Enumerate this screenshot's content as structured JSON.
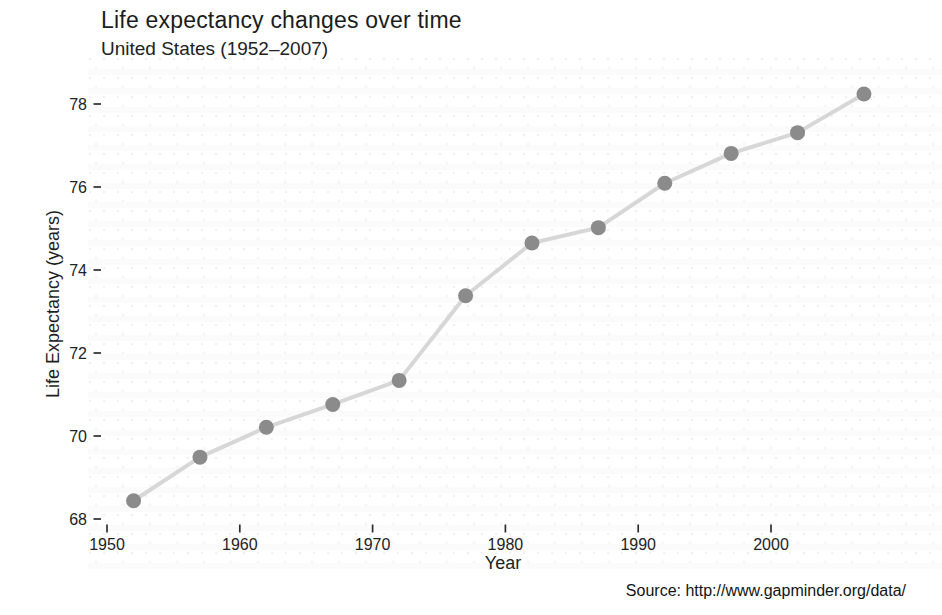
{
  "chart_data": {
    "type": "line",
    "title": "Life expectancy changes over time",
    "subtitle": "United States (1952–2007)",
    "caption": "Source: http://www.gapminder.org/data/",
    "xlabel": "Year",
    "ylabel": "Life Expectancy (years)",
    "x": [
      1952,
      1957,
      1962,
      1967,
      1972,
      1977,
      1982,
      1987,
      1992,
      1997,
      2002,
      2007
    ],
    "series": [
      {
        "name": "United States",
        "values": [
          68.44,
          69.49,
          70.21,
          70.76,
          71.34,
          73.38,
          74.65,
          75.02,
          76.09,
          76.81,
          77.31,
          78.24
        ]
      }
    ],
    "x_ticks": [
      1950,
      1960,
      1970,
      1980,
      1990,
      2000
    ],
    "y_ticks": [
      68,
      70,
      72,
      74,
      76,
      78
    ],
    "xlim": [
      1949.2,
      2010.2
    ],
    "ylim": [
      67.95,
      78.5
    ],
    "grid": false,
    "legend": false,
    "marker": "circle",
    "colors": {
      "point": "#8b8b8b",
      "line": "#d7d7d7",
      "tick": "#2d2d2d",
      "text": "#232323"
    }
  }
}
